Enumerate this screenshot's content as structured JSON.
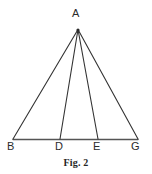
{
  "figure": {
    "caption": "Fig. 2",
    "background_color": "#ffffff",
    "stroke_color": "#333333",
    "baseline_color": "#555555",
    "label_color": "#2b2b2b",
    "width": 152,
    "height": 174
  },
  "chart_data": {
    "type": "diagram",
    "title": "Fig. 2",
    "points": [
      {
        "name": "A",
        "x": 78,
        "y": 29,
        "label": "A",
        "label_x": 77,
        "label_y": 14
      },
      {
        "name": "B",
        "x": 13,
        "y": 139,
        "label": "B",
        "label_x": 12,
        "label_y": 147
      },
      {
        "name": "D",
        "x": 60,
        "y": 139,
        "label": "D",
        "label_x": 59,
        "label_y": 147
      },
      {
        "name": "E",
        "x": 98,
        "y": 139,
        "label": "E",
        "label_x": 97,
        "label_y": 147
      },
      {
        "name": "G",
        "x": 138,
        "y": 139,
        "label": "G",
        "label_x": 135,
        "label_y": 147
      }
    ],
    "segments": [
      {
        "name": "AB",
        "from": "A",
        "to": "B"
      },
      {
        "name": "AD",
        "from": "A",
        "to": "D"
      },
      {
        "name": "AE",
        "from": "A",
        "to": "E"
      },
      {
        "name": "AG",
        "from": "A",
        "to": "G"
      },
      {
        "name": "BG",
        "from": "B",
        "to": "G"
      }
    ],
    "labels": [
      "A",
      "B",
      "D",
      "E",
      "G"
    ]
  }
}
